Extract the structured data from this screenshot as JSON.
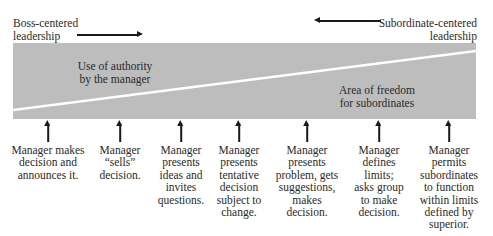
{
  "header": {
    "left_label": [
      "Boss-centered",
      "leadership"
    ],
    "right_label": [
      "Subordinate-centered",
      "leadership"
    ]
  },
  "band": {
    "upper_label": [
      "Use of authority",
      "by the manager"
    ],
    "lower_label": [
      "Area of freedom",
      "for subordinates"
    ],
    "fill_color": "#bdbdbd",
    "divider_color": "#ffffff"
  },
  "behaviors": [
    {
      "x": 48,
      "lines": [
        "Manager makes",
        "decision and",
        "announces it."
      ]
    },
    {
      "x": 120,
      "lines": [
        "Manager",
        "“sells”",
        "decision."
      ]
    },
    {
      "x": 181,
      "lines": [
        "Manager",
        "presents",
        "ideas and",
        "invites",
        "questions."
      ]
    },
    {
      "x": 239,
      "lines": [
        "Manager",
        "presents",
        "tentative",
        "decision",
        "subject to",
        "change."
      ]
    },
    {
      "x": 307,
      "lines": [
        "Manager",
        "presents",
        "problem, gets",
        "suggestions,",
        "makes",
        "decision."
      ]
    },
    {
      "x": 379,
      "lines": [
        "Manager",
        "defines",
        "limits;",
        "asks group",
        "to make",
        "decision."
      ]
    },
    {
      "x": 449,
      "lines": [
        "Manager",
        "permits",
        "subordinates",
        "to function",
        "within limits",
        "defined by",
        "superior."
      ]
    }
  ]
}
